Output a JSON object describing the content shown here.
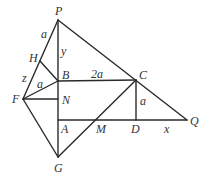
{
  "diagram": {
    "title": "",
    "points": {
      "P": {
        "label": "P",
        "x": 58,
        "y": 20
      },
      "H": {
        "label": "H",
        "x": 40,
        "y": 61
      },
      "B": {
        "label": "B",
        "x": 58,
        "y": 81
      },
      "C": {
        "label": "C",
        "x": 136,
        "y": 80
      },
      "F": {
        "label": "F",
        "x": 23,
        "y": 99
      },
      "N": {
        "label": "N",
        "x": 58,
        "y": 99
      },
      "A": {
        "label": "A",
        "x": 58,
        "y": 120
      },
      "M": {
        "label": "M",
        "x": 100,
        "y": 120
      },
      "D": {
        "label": "D",
        "x": 136,
        "y": 120
      },
      "Q": {
        "label": "Q",
        "x": 187,
        "y": 120
      },
      "G": {
        "label": "G",
        "x": 58,
        "y": 157
      }
    },
    "segments": [
      [
        "P",
        "G"
      ],
      [
        "P",
        "F"
      ],
      [
        "P",
        "Q"
      ],
      [
        "H",
        "B"
      ],
      [
        "F",
        "B"
      ],
      [
        "F",
        "N"
      ],
      [
        "F",
        "G"
      ],
      [
        "B",
        "C"
      ],
      [
        "A",
        "Q"
      ],
      [
        "C",
        "D"
      ],
      [
        "G",
        "C"
      ]
    ],
    "measure_labels": {
      "PH": "a",
      "PB": "y",
      "HF": "z",
      "FB": "a",
      "BC": "2a",
      "CD": "a",
      "DQ": "x"
    }
  }
}
